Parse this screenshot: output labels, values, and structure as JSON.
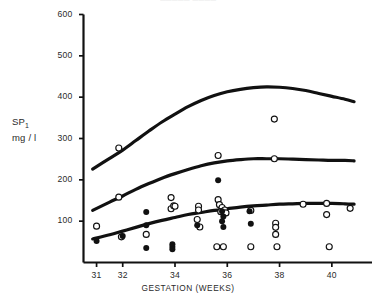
{
  "figure": {
    "title_remnant": "░░░░░                                        ░░░░",
    "background": "#ffffff",
    "ink_color": "#111111"
  },
  "axes": {
    "y": {
      "label_line1": "SP",
      "label_sub": "1",
      "label_line2": "mg / l",
      "ticks": [
        100,
        200,
        300,
        400,
        500,
        600
      ],
      "tick_labels": [
        "100",
        "200",
        "300",
        "400",
        "500",
        "600"
      ],
      "min": 0,
      "max": 600
    },
    "x": {
      "label": "GESTATION (WEEKS)",
      "ticks": [
        31,
        32,
        34,
        36,
        38,
        40
      ],
      "tick_labels": [
        "31",
        "32",
        "34",
        "36",
        "38",
        "40"
      ],
      "min": 30.5,
      "max": 41.0
    }
  },
  "chart_data": {
    "type": "scatter",
    "title": "",
    "xlabel": "GESTATION (WEEKS)",
    "ylabel": "SP1 mg / l",
    "xlim": [
      30.5,
      41.0
    ],
    "ylim": [
      0,
      600
    ],
    "grid": false,
    "legend_position": "none",
    "series": [
      {
        "name": "open-circles",
        "marker": "open-circle",
        "color": "#111111",
        "points": [
          [
            31.0,
            88
          ],
          [
            31.85,
            277
          ],
          [
            31.85,
            158
          ],
          [
            31.95,
            62
          ],
          [
            32.9,
            68
          ],
          [
            33.85,
            157
          ],
          [
            33.85,
            130
          ],
          [
            33.95,
            137
          ],
          [
            34.0,
            136
          ],
          [
            34.9,
            136
          ],
          [
            34.9,
            127
          ],
          [
            34.85,
            104
          ],
          [
            34.95,
            86
          ],
          [
            35.65,
            259
          ],
          [
            35.65,
            152
          ],
          [
            35.7,
            140
          ],
          [
            35.8,
            133
          ],
          [
            35.75,
            123
          ],
          [
            35.9,
            127
          ],
          [
            35.95,
            120
          ],
          [
            35.6,
            38
          ],
          [
            35.85,
            38
          ],
          [
            36.9,
            126
          ],
          [
            36.9,
            38
          ],
          [
            37.8,
            347
          ],
          [
            37.8,
            251
          ],
          [
            37.85,
            95
          ],
          [
            37.85,
            85
          ],
          [
            37.85,
            68
          ],
          [
            37.9,
            38
          ],
          [
            38.9,
            141
          ],
          [
            39.8,
            143
          ],
          [
            39.8,
            116
          ],
          [
            39.9,
            38
          ],
          [
            40.7,
            131
          ]
        ]
      },
      {
        "name": "filled-circles",
        "marker": "filled-circle",
        "color": "#111111",
        "points": [
          [
            31.0,
            52
          ],
          [
            32.0,
            64
          ],
          [
            32.9,
            122
          ],
          [
            32.9,
            90
          ],
          [
            32.9,
            35
          ],
          [
            33.9,
            44
          ],
          [
            33.9,
            38
          ],
          [
            33.9,
            32
          ],
          [
            34.85,
            90
          ],
          [
            35.65,
            199
          ],
          [
            35.8,
            124
          ],
          [
            35.85,
            111
          ],
          [
            35.8,
            100
          ],
          [
            35.85,
            86
          ],
          [
            36.85,
            124
          ],
          [
            36.9,
            94
          ]
        ]
      }
    ],
    "curves": [
      {
        "name": "upper-centile-curve",
        "style": "solid",
        "width_px": 3.2,
        "points": [
          [
            30.85,
            226
          ],
          [
            31.5,
            252
          ],
          [
            32.0,
            272
          ],
          [
            32.5,
            295
          ],
          [
            33.0,
            318
          ],
          [
            33.5,
            340
          ],
          [
            34.0,
            359
          ],
          [
            34.5,
            377
          ],
          [
            35.0,
            392
          ],
          [
            35.5,
            404
          ],
          [
            36.0,
            413
          ],
          [
            36.5,
            419
          ],
          [
            37.0,
            423
          ],
          [
            37.5,
            425
          ],
          [
            38.0,
            424
          ],
          [
            38.5,
            421
          ],
          [
            39.0,
            416
          ],
          [
            39.5,
            409
          ],
          [
            40.0,
            402
          ],
          [
            40.5,
            395
          ],
          [
            40.85,
            389
          ]
        ]
      },
      {
        "name": "middle-centile-curve",
        "style": "solid",
        "width_px": 3.2,
        "points": [
          [
            30.85,
            126
          ],
          [
            31.5,
            146
          ],
          [
            32.0,
            161
          ],
          [
            32.5,
            177
          ],
          [
            33.0,
            191
          ],
          [
            33.5,
            204
          ],
          [
            34.0,
            215
          ],
          [
            34.5,
            225
          ],
          [
            35.0,
            234
          ],
          [
            35.5,
            241
          ],
          [
            36.0,
            246
          ],
          [
            36.5,
            249
          ],
          [
            37.0,
            251
          ],
          [
            37.5,
            251
          ],
          [
            38.0,
            251
          ],
          [
            38.5,
            250
          ],
          [
            39.0,
            249
          ],
          [
            39.5,
            248
          ],
          [
            40.0,
            247
          ],
          [
            40.5,
            247
          ],
          [
            40.85,
            246
          ]
        ]
      },
      {
        "name": "lower-centile-curve",
        "style": "solid",
        "width_px": 3.2,
        "points": [
          [
            30.85,
            57
          ],
          [
            31.5,
            67
          ],
          [
            32.0,
            76
          ],
          [
            32.5,
            85
          ],
          [
            33.0,
            94
          ],
          [
            33.5,
            102
          ],
          [
            34.0,
            109
          ],
          [
            34.5,
            116
          ],
          [
            35.0,
            121
          ],
          [
            35.5,
            126
          ],
          [
            36.0,
            130
          ],
          [
            36.5,
            134
          ],
          [
            37.0,
            137
          ],
          [
            37.5,
            139
          ],
          [
            38.0,
            141
          ],
          [
            38.5,
            142
          ],
          [
            39.0,
            143
          ],
          [
            39.5,
            143
          ],
          [
            40.0,
            143
          ],
          [
            40.5,
            142
          ],
          [
            40.85,
            141
          ]
        ]
      }
    ]
  }
}
